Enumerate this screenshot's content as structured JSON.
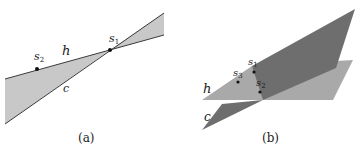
{
  "panel_a": {
    "caption": "(a)",
    "labels": {
      "s1": "s",
      "s1_sub": "1",
      "s2": "s",
      "s2_sub": "2",
      "h": "h",
      "c": "c"
    }
  },
  "panel_b": {
    "caption": "(b)",
    "labels": {
      "s1": "s",
      "s1_sub": "1",
      "s2": "s",
      "s2_sub": "2",
      "s3": "s",
      "s3_sub": "3",
      "h": "h",
      "c": "c"
    }
  },
  "colors": {
    "light_fill": "#c8c8c8",
    "plane_h": "#a9a9a9",
    "plane_c": "#6e6e6e",
    "line": "#3a3a3a"
  }
}
